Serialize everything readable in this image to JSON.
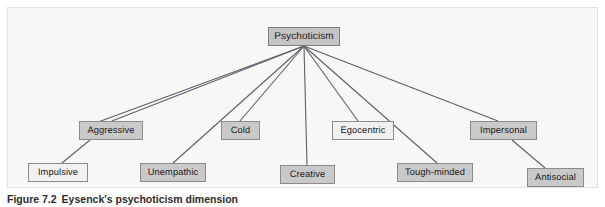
{
  "figure": {
    "caption_label": "Figure 7.2",
    "caption_text": "Eysenck's psychoticism dimension",
    "background_color": "#f7f7f6",
    "panel_border_color": "#e2e2e0",
    "line_color": "#5a5f6b"
  },
  "diagram": {
    "type": "hierarchy-tree",
    "root": {
      "id": "psychoticism",
      "label": "Psychoticism",
      "fill": "#c4c4c4",
      "x": 268,
      "y": 27,
      "w": 72,
      "h": 19
    },
    "nodes": [
      {
        "id": "aggressive",
        "label": "Aggressive",
        "level": 1,
        "fill": "#c9c9c9",
        "x": 79,
        "y": 121,
        "w": 64,
        "h": 19
      },
      {
        "id": "cold",
        "label": "Cold",
        "level": 1,
        "fill": "#c9c9c9",
        "x": 221,
        "y": 121,
        "w": 39,
        "h": 19
      },
      {
        "id": "egocentric",
        "label": "Egocentric",
        "level": 1,
        "fill": "#f1f1f0",
        "x": 332,
        "y": 121,
        "w": 62,
        "h": 19
      },
      {
        "id": "impersonal",
        "label": "Impersonal",
        "level": 1,
        "fill": "#c9c9c9",
        "x": 470,
        "y": 121,
        "w": 67,
        "h": 19
      },
      {
        "id": "impulsive",
        "label": "Impulsive",
        "level": 2,
        "fill": "#f1f1f0",
        "x": 28,
        "y": 163,
        "w": 60,
        "h": 19
      },
      {
        "id": "unempathic",
        "label": "Unempathic",
        "level": 2,
        "fill": "#c9c9c9",
        "x": 140,
        "y": 163,
        "w": 66,
        "h": 19
      },
      {
        "id": "creative",
        "label": "Creative",
        "level": 2,
        "fill": "#c9c9c9",
        "x": 280,
        "y": 165,
        "w": 55,
        "h": 19
      },
      {
        "id": "tough-minded",
        "label": "Tough-minded",
        "level": 2,
        "fill": "#c9c9c9",
        "x": 397,
        "y": 163,
        "w": 76,
        "h": 19
      },
      {
        "id": "antisocial",
        "label": "Antisocial",
        "level": 2,
        "fill": "#c9c9c9",
        "x": 527,
        "y": 168,
        "w": 57,
        "h": 19
      }
    ],
    "hub": {
      "x": 304,
      "y": 46
    },
    "edges": [
      {
        "from": "psychoticism",
        "to": "aggressive",
        "x1": 304,
        "y1": 46,
        "x2": 112,
        "y2": 121
      },
      {
        "from": "psychoticism",
        "to": "impulsive",
        "x1": 304,
        "y1": 46,
        "x2": 82,
        "y2": 128
      },
      {
        "from": "psychoticism",
        "to": "unempathic",
        "x1": 304,
        "y1": 46,
        "x2": 173,
        "y2": 163
      },
      {
        "from": "psychoticism",
        "to": "cold",
        "x1": 304,
        "y1": 46,
        "x2": 240,
        "y2": 121
      },
      {
        "from": "psychoticism",
        "to": "creative",
        "x1": 304,
        "y1": 46,
        "x2": 307,
        "y2": 165
      },
      {
        "from": "psychoticism",
        "to": "egocentric",
        "x1": 304,
        "y1": 46,
        "x2": 358,
        "y2": 121
      },
      {
        "from": "psychoticism",
        "to": "tough-minded",
        "x1": 304,
        "y1": 46,
        "x2": 437,
        "y2": 163
      },
      {
        "from": "psychoticism",
        "to": "impersonal",
        "x1": 304,
        "y1": 46,
        "x2": 498,
        "y2": 121
      },
      {
        "from": "aggressive",
        "to": "impulsive",
        "x1": 90,
        "y1": 140,
        "x2": 62,
        "y2": 163
      },
      {
        "from": "impersonal",
        "to": "antisocial",
        "x1": 512,
        "y1": 140,
        "x2": 545,
        "y2": 168
      }
    ]
  }
}
